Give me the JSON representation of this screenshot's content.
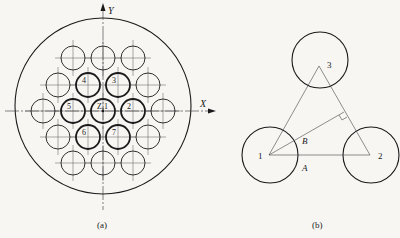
{
  "figure_a": {
    "caption": "(a)",
    "axis_x_label": "X",
    "axis_y_label": "Y",
    "outer_circle": {
      "cx": 103,
      "cy": 106,
      "r": 88
    },
    "tube_radius": 12,
    "tubes": [
      {
        "cx": 73,
        "cy": 58,
        "label": "",
        "bold": false
      },
      {
        "cx": 103,
        "cy": 58,
        "label": "",
        "bold": false
      },
      {
        "cx": 133,
        "cy": 58,
        "label": "",
        "bold": false
      },
      {
        "cx": 58,
        "cy": 85,
        "label": "",
        "bold": false
      },
      {
        "cx": 88,
        "cy": 85,
        "label": "4",
        "bold": true
      },
      {
        "cx": 118,
        "cy": 85,
        "label": "3",
        "bold": true
      },
      {
        "cx": 148,
        "cy": 85,
        "label": "",
        "bold": false
      },
      {
        "cx": 43,
        "cy": 111,
        "label": "",
        "bold": false
      },
      {
        "cx": 73,
        "cy": 111,
        "label": "5",
        "bold": true
      },
      {
        "cx": 103,
        "cy": 111,
        "label": "Z,1",
        "bold": true
      },
      {
        "cx": 133,
        "cy": 111,
        "label": "2",
        "bold": true
      },
      {
        "cx": 163,
        "cy": 111,
        "label": "",
        "bold": false
      },
      {
        "cx": 58,
        "cy": 137,
        "label": "",
        "bold": false
      },
      {
        "cx": 88,
        "cy": 137,
        "label": "6",
        "bold": true
      },
      {
        "cx": 118,
        "cy": 137,
        "label": "7",
        "bold": true
      },
      {
        "cx": 148,
        "cy": 137,
        "label": "",
        "bold": false
      },
      {
        "cx": 73,
        "cy": 163,
        "label": "",
        "bold": false
      },
      {
        "cx": 103,
        "cy": 163,
        "label": "",
        "bold": false
      },
      {
        "cx": 133,
        "cy": 163,
        "label": "",
        "bold": false
      }
    ]
  },
  "figure_b": {
    "caption": "(b)",
    "circle_radius": 28,
    "nodes": [
      {
        "id": "1",
        "cx": 269,
        "cy": 155
      },
      {
        "id": "2",
        "cx": 370,
        "cy": 155
      },
      {
        "id": "3",
        "cx": 320,
        "cy": 63
      }
    ],
    "segment_labels": {
      "A": "A",
      "B": "B"
    }
  },
  "colors": {
    "ink": "#1a1a1a",
    "paper": "#f7f6f3",
    "thin": "#444444"
  }
}
